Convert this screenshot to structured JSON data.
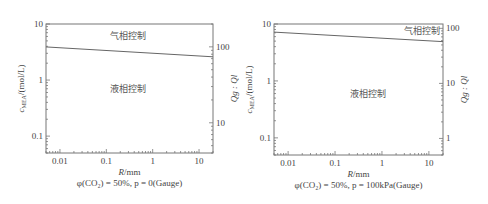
{
  "chart_data": [
    {
      "type": "line",
      "title": "",
      "caption": "φ(CO₂) = 50%, p = 0(Gauge)",
      "xlabel": "R/mm",
      "ylabel": "c_MEA/(mol/L)",
      "ylabel_right": "Q_g : Q_l",
      "xscale": "log",
      "yscale": "log",
      "xlim": [
        0.005,
        20
      ],
      "ylim": [
        0.05,
        10
      ],
      "ylim_right": [
        4,
        200
      ],
      "xticks": [
        0.01,
        0.1,
        1,
        10
      ],
      "xtick_labels": [
        "0.01",
        "0.1",
        "1",
        "10"
      ],
      "yticks": [
        0.1,
        1,
        10
      ],
      "ytick_labels": [
        "0.1",
        "1",
        "10"
      ],
      "yticks_right": [
        10,
        100
      ],
      "ytick_right_labels": [
        "10",
        "100"
      ],
      "series": [
        {
          "name": "boundary",
          "x": [
            0.005,
            20
          ],
          "y": [
            3.9,
            2.6
          ]
        }
      ],
      "annotations": [
        {
          "text": "气相控制",
          "x": 0.3,
          "y": 6.0
        },
        {
          "text": "液相控制",
          "x": 0.3,
          "y": 0.7
        }
      ],
      "grid": false
    },
    {
      "type": "line",
      "title": "",
      "caption": "φ(CO₂) = 50%, p = 100kPa(Gauge)",
      "xlabel": "R/mm",
      "ylabel": "c_MEA/(mol/L)",
      "ylabel_right": "Q_g : Q_l",
      "xscale": "log",
      "yscale": "log",
      "xlim": [
        0.005,
        20
      ],
      "ylim": [
        0.05,
        10
      ],
      "ylim_right": [
        0.5,
        120
      ],
      "xticks": [
        0.01,
        0.1,
        1,
        10
      ],
      "xtick_labels": [
        "0.01",
        "0.1",
        "1",
        "10"
      ],
      "yticks": [
        0.1,
        1,
        10
      ],
      "ytick_labels": [
        "0.1",
        "1",
        "10"
      ],
      "yticks_right": [
        1,
        10,
        100
      ],
      "ytick_right_labels": [
        "1",
        "10",
        "100"
      ],
      "series": [
        {
          "name": "boundary",
          "x": [
            0.005,
            20
          ],
          "y": [
            7.2,
            4.9
          ]
        }
      ],
      "annotations": [
        {
          "text": "气相控制",
          "x": 7,
          "y": 7.5
        },
        {
          "text": "液相控制",
          "x": 0.5,
          "y": 0.6
        }
      ],
      "grid": false
    }
  ]
}
